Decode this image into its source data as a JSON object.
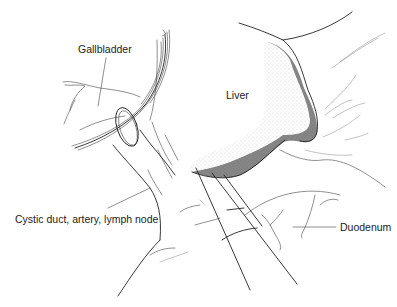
{
  "figure": {
    "type": "anatomical illustration",
    "labels": {
      "gallbladder": "Gallbladder",
      "liver": "Liver",
      "cystic": "Cystic duct, artery, lymph node",
      "duodenum": "Duodenum"
    }
  }
}
